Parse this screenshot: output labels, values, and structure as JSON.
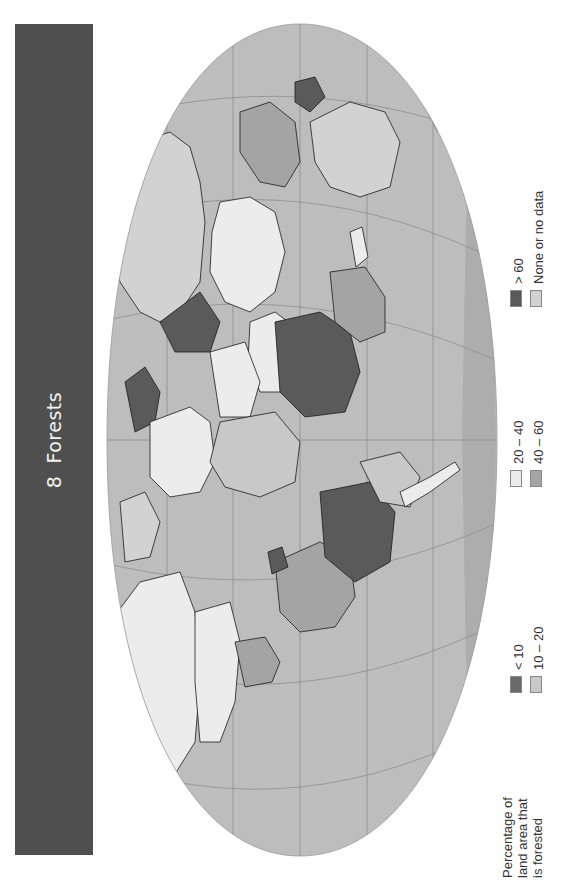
{
  "title": {
    "number": "8",
    "text": "Forests"
  },
  "legend": {
    "title_lines": [
      "Percentage of",
      "land area that",
      "is forested"
    ],
    "items": [
      {
        "label": "< 10",
        "color": "#6a6a6a"
      },
      {
        "label": "10 – 20",
        "color": "#c8c8c8"
      },
      {
        "label": "20 – 40",
        "color": "#ececec"
      },
      {
        "label": "40 – 60",
        "color": "#a4a4a4"
      },
      {
        "label": "> 60",
        "color": "#5a5a5a"
      },
      {
        "label": "None or no data",
        "color": "#d2d2d2"
      }
    ]
  },
  "colors": {
    "title_band": "#4f4f4f",
    "ocean": "#bdbdbd",
    "graticule": "#8e8e8e",
    "coast": "#1a1a1a"
  },
  "map": {
    "projection": "Robinson (rotated 90°, north to the left)",
    "orientation_note": "Map rotated counter-clockwise; North America at bottom-left, Africa/Europe center, Australia top-right"
  }
}
